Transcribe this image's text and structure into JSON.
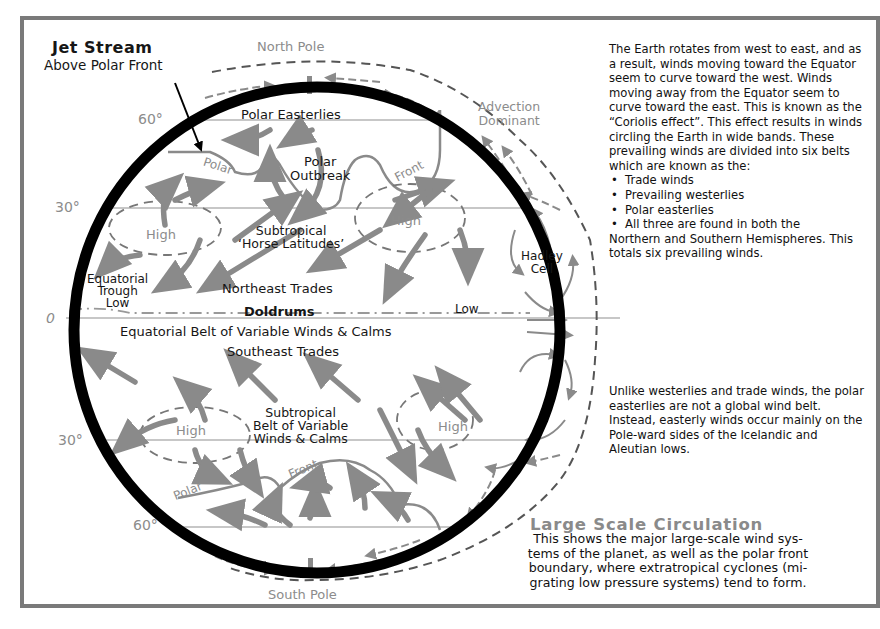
{
  "diagram": {
    "title": "Large Scale Circulation",
    "caption": "This shows the major large-scale wind systems of the planet, as well as the polar front boundary, where extratropical cyclones (migrating low pressure systems) tend to form.",
    "caption_lines": [
      "This shows the major large-scale wind sys-",
      "tems of the planet, as well as the polar front",
      "boundary, where extratropical cyclones (mi-",
      "grating low pressure systems) tend to form."
    ],
    "callout": {
      "title": "Jet Stream",
      "subtitle": "Above Polar Front"
    },
    "poles": {
      "north": "North Pole",
      "south": "South Pole"
    },
    "latitudes": {
      "n60": "60°",
      "n30": "30°",
      "equator": "0",
      "s30": "30°",
      "s60": "60°"
    },
    "labels": {
      "advection": [
        "Advection",
        "Dominant"
      ],
      "polar_easterlies": "Polar Easterlies",
      "polar_n": "Polar",
      "front_n": "Front",
      "polar_outbreak": [
        "Polar",
        "Outbreak"
      ],
      "high_nw": "High",
      "high_ne": "High",
      "subtropical_horse": [
        "Subtropical",
        "‘Horse Latitudes’"
      ],
      "hadley_cell": [
        "Hadley",
        "Cell"
      ],
      "equatorial_trough": [
        "Equatorial",
        "Trough",
        "Low"
      ],
      "northeast_trades": "Northeast Trades",
      "doldrums": "Doldrums",
      "low_e": "Low",
      "equatorial_belt": "Equatorial Belt of Variable Winds & Calms",
      "southeast_trades": "Southeast Trades",
      "high_sw": "High",
      "high_se": "High",
      "subtropical_belt": [
        "Subtropical",
        "Belt of Variable",
        "Winds & Calms"
      ],
      "front_s": "Front",
      "polar_s": "Polar"
    },
    "colors": {
      "earth_outline": "#000000",
      "arrows": "#8a8a8a",
      "gray_text": "#8c8c8c",
      "latitude_lines": "#b0b0b0",
      "frame": "#7a7a7a"
    }
  },
  "sidebar": {
    "paragraph1": "The Earth rotates from west to east, and as a result, winds moving toward the Equator seem to curve toward the west. Winds moving away from the Equator seem to curve toward the east. This is known as the “Coriolis effect”.  This effect results in winds circling the Earth in wide bands. These prevailing winds are divided into six belts which are known as the:",
    "bullets": [
      "Trade winds",
      "Prevailing westerlies",
      "Polar easterlies",
      "All three are found in both the"
    ],
    "continuation": "Northern and Southern Hemispheres. This totals six prevailing winds.",
    "paragraph2": "Unlike westerlies and trade winds, the polar easterlies are not a global wind belt. Instead, easterly winds occur mainly on the Pole-ward sides of the Icelandic and Aleutian lows."
  }
}
